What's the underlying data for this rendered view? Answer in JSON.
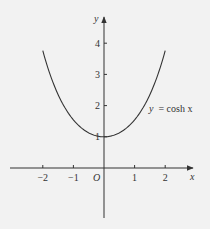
{
  "chart_data": {
    "type": "line",
    "title": "",
    "xlabel": "x",
    "ylabel": "y",
    "origin_label": "O",
    "series": [
      {
        "name": "y = cosh x",
        "function": "cosh",
        "x_range": [
          -2,
          2
        ]
      }
    ],
    "x_ticks": [
      "−2",
      "−1",
      "1",
      "2"
    ],
    "x_tick_values": [
      -2,
      -1,
      1,
      2
    ],
    "y_ticks": [
      "1",
      "2",
      "3",
      "4"
    ],
    "y_tick_values": [
      1,
      2,
      3,
      4
    ],
    "xlim": [
      -3.1,
      2.9
    ],
    "ylim": [
      -1.5,
      4.6
    ],
    "grid": false,
    "annotation": {
      "label_prefix": "y",
      "label_suffix": "= cosh x",
      "x": 1.3,
      "y": 2.05
    }
  },
  "colors": {
    "background": "#f2f2f2",
    "ink": "#333333"
  }
}
